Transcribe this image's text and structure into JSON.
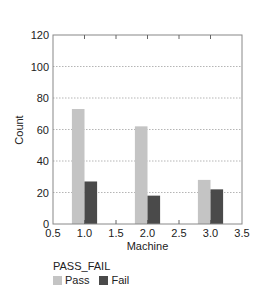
{
  "chart_data": {
    "type": "bar",
    "title": "",
    "xlabel": "Machine",
    "ylabel": "Count",
    "x": [
      1.0,
      2.0,
      3.0
    ],
    "categories": [
      "1.0",
      "2.0",
      "3.0"
    ],
    "series": [
      {
        "name": "Pass",
        "values": [
          73,
          62,
          28
        ],
        "color": "#c4c4c4"
      },
      {
        "name": "Fail",
        "values": [
          27,
          18,
          22
        ],
        "color": "#4a4a4a"
      }
    ],
    "xlim": [
      0.5,
      3.5
    ],
    "ylim": [
      0,
      120
    ],
    "xticks": [
      "0.5",
      "1.0",
      "1.5",
      "2.0",
      "2.5",
      "3.0",
      "3.5"
    ],
    "yticks": [
      "0",
      "20",
      "40",
      "60",
      "80",
      "100",
      "120"
    ],
    "grid": "horizontal dotted",
    "legend_position": "bottom-left"
  },
  "legend": {
    "title": "PASS_FAIL",
    "items": [
      {
        "label": "Pass",
        "color": "#c4c4c4"
      },
      {
        "label": "Fail",
        "color": "#4a4a4a"
      }
    ]
  }
}
